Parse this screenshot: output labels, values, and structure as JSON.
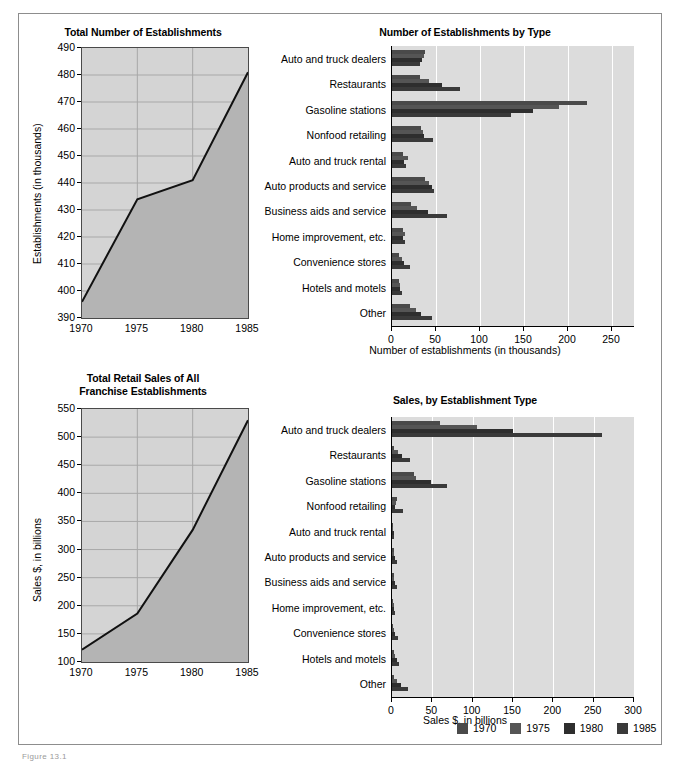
{
  "figure": {
    "caption": "Figure 13.1"
  },
  "legend": {
    "position": "bottom-right",
    "items": [
      {
        "label": "1970",
        "color": "#4a4a4a"
      },
      {
        "label": "1975",
        "color": "#555555"
      },
      {
        "label": "1980",
        "color": "#2e2e2e"
      },
      {
        "label": "1985",
        "color": "#3a3a3a"
      }
    ]
  },
  "chart_data": [
    {
      "id": "total-establishments",
      "type": "line",
      "title": "Total Number of Establishments",
      "xlabel": "",
      "ylabel": "Establishments (in thousands)",
      "x": [
        1970,
        1975,
        1980,
        1985
      ],
      "xticklabels": [
        "1970",
        "1975",
        "1980",
        "1985"
      ],
      "values": [
        396,
        434,
        441,
        481
      ],
      "yticks": [
        390,
        400,
        410,
        420,
        430,
        440,
        450,
        460,
        470,
        480,
        490
      ],
      "ylim": [
        390,
        490
      ],
      "xlim": [
        1970,
        1985
      ],
      "grid": true,
      "fill": true,
      "plot_bg": "#d4d4d4",
      "fill_color": "#b4b4b4"
    },
    {
      "id": "establishments-by-type",
      "type": "bar",
      "orientation": "horizontal",
      "title": "Number of Establishments by Type",
      "xlabel": "Number of establishments (in thousands)",
      "ylabel": "",
      "categories": [
        "Auto and truck dealers",
        "Restaurants",
        "Gasoline stations",
        "Nonfood retailing",
        "Auto and truck rental",
        "Auto products  and service",
        "Business aids and service",
        "Home improvement, etc.",
        "Convenience stores",
        "Hotels and motels",
        "Other"
      ],
      "series": [
        {
          "name": "1970",
          "values": [
            37,
            32,
            222,
            33,
            13,
            38,
            22,
            13,
            8,
            8,
            21
          ]
        },
        {
          "name": "1975",
          "values": [
            36,
            42,
            190,
            35,
            18,
            42,
            28,
            15,
            11,
            9,
            27
          ]
        },
        {
          "name": "1980",
          "values": [
            34,
            57,
            160,
            36,
            14,
            45,
            41,
            13,
            14,
            9,
            33
          ]
        },
        {
          "name": "1985",
          "values": [
            32,
            77,
            135,
            47,
            16,
            48,
            62,
            15,
            21,
            11,
            46
          ]
        }
      ],
      "xticks": [
        0,
        50,
        100,
        150,
        200,
        250
      ],
      "xticklabels": [
        "0",
        "50",
        "100",
        "150",
        "200",
        "250"
      ],
      "xlim": [
        0,
        275
      ],
      "grid": true,
      "plot_bg": "#dcdcdc"
    },
    {
      "id": "total-retail-sales",
      "type": "line",
      "title": "Total Retail Sales of All Franchise Establishments",
      "title_line1": "Total Retail Sales of All",
      "title_line2": "Franchise Establishments",
      "xlabel": "",
      "ylabel": "Sales $, in billions",
      "x": [
        1970,
        1975,
        1980,
        1985
      ],
      "xticklabels": [
        "1970",
        "1975",
        "1980",
        "1985"
      ],
      "values": [
        122,
        186,
        335,
        530
      ],
      "yticks": [
        100,
        150,
        200,
        250,
        300,
        350,
        400,
        450,
        500,
        550
      ],
      "ylim": [
        100,
        550
      ],
      "xlim": [
        1970,
        1985
      ],
      "grid": true,
      "fill": true,
      "plot_bg": "#d4d4d4",
      "fill_color": "#b4b4b4"
    },
    {
      "id": "sales-by-type",
      "type": "bar",
      "orientation": "horizontal",
      "title": "Sales, by Establishment Type",
      "xlabel": "Sales $, in billions",
      "ylabel": "",
      "categories": [
        "Auto and truck dealers",
        "Restaurants",
        "Gasoline stations",
        "Nonfood retailing",
        "Auto and truck rental",
        "Auto products  and service",
        "Business aids and service",
        "Home improvement, etc.",
        "Convenience stores",
        "Hotels and motels",
        "Other"
      ],
      "series": [
        {
          "name": "1970",
          "values": [
            60,
            2,
            27,
            6,
            1,
            2,
            2,
            1,
            1,
            3,
            3
          ]
        },
        {
          "name": "1975",
          "values": [
            105,
            8,
            30,
            5,
            1,
            3,
            3,
            2,
            2,
            4,
            6
          ]
        },
        {
          "name": "1980",
          "values": [
            150,
            13,
            48,
            4,
            2,
            4,
            4,
            3,
            4,
            6,
            11
          ]
        },
        {
          "name": "1985",
          "values": [
            260,
            22,
            68,
            14,
            3,
            6,
            6,
            4,
            7,
            9,
            20
          ]
        }
      ],
      "xticks": [
        0,
        50,
        100,
        150,
        200,
        250,
        300
      ],
      "xticklabels": [
        "0",
        "50",
        "100",
        "150",
        "200",
        "250",
        "300"
      ],
      "xlim": [
        0,
        300
      ],
      "grid": true,
      "plot_bg": "#dcdcdc"
    }
  ]
}
